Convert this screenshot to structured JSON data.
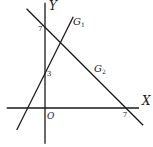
{
  "diagram": {
    "axes": {
      "x_label": "X",
      "y_label": "Y",
      "origin_label": "O",
      "x_range": [
        -3.4,
        8.4
      ],
      "y_range": [
        -3.0,
        9.2
      ]
    },
    "ticks": {
      "x_tick_label": "7",
      "x_tick_value": 7,
      "y_tick_labels": [
        {
          "label": "7",
          "value": 7
        },
        {
          "label": "3",
          "value": 3
        }
      ]
    },
    "lines": [
      {
        "name": "G",
        "subscript": "1",
        "equation": "y = 2x + 3",
        "slope": 2,
        "intercept": 3,
        "x_span": [
          -2.45,
          2.45
        ]
      },
      {
        "name": "G",
        "subscript": "2",
        "equation": "y = 7 - x",
        "slope": -1,
        "intercept": 7,
        "x_span": [
          -1.6,
          8.5
        ]
      }
    ]
  }
}
